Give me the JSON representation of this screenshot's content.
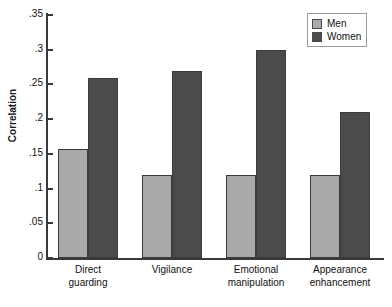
{
  "chart_data": {
    "type": "bar",
    "title": "",
    "xlabel": "",
    "ylabel": "Correlation",
    "ylim": [
      0,
      0.35
    ],
    "grid": false,
    "legend_position": "top-right",
    "categories": [
      "Direct\nguarding",
      "Vigilance",
      "Emotional\nmanipulation",
      "Appearance\nenhancement"
    ],
    "category_lines": [
      [
        "Direct",
        "guarding"
      ],
      [
        "Vigilance",
        ""
      ],
      [
        "Emotional",
        "manipulation"
      ],
      [
        "Appearance",
        "enhancement"
      ]
    ],
    "ytick_labels": [
      ".35",
      ".3",
      ".25",
      ".2",
      ".15",
      ".1",
      ".05",
      "0"
    ],
    "ytick_values": [
      0.35,
      0.3,
      0.25,
      0.2,
      0.15,
      0.1,
      0.05,
      0
    ],
    "series": [
      {
        "name": "Men",
        "color": "#a9a9a9",
        "values": [
          0.157,
          0.12,
          0.12,
          0.12
        ]
      },
      {
        "name": "Women",
        "color": "#4b4b4b",
        "values": [
          0.26,
          0.27,
          0.3,
          0.21
        ]
      }
    ]
  },
  "legend": {
    "entries": [
      {
        "label": "Men"
      },
      {
        "label": "Women"
      }
    ]
  },
  "axis": {
    "y_title": "Correlation"
  }
}
